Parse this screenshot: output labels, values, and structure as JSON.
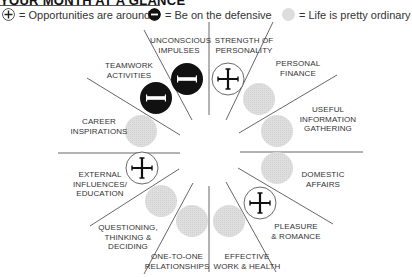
{
  "title": "YOUR MONTH AT A GLANCE",
  "legend": [
    {
      "icon": "plus-circle-icon",
      "text": "= Opportunities are around"
    },
    {
      "icon": "minus-circle-icon",
      "text": "= Be on the defensive"
    },
    {
      "icon": "gray-circle-icon",
      "text": "= Life is pretty ordinary"
    }
  ],
  "colors": {
    "plus": "#ffffff",
    "minus": "#111111",
    "ordinary": "#dcdcdc",
    "lines": "#555555"
  },
  "sectors": [
    {
      "label": "STRENGTH OF\nPERSONALITY",
      "status": "plus"
    },
    {
      "label": "PERSONAL\nFINANCE",
      "status": "ordinary"
    },
    {
      "label": "USEFUL\nINFORMATION\nGATHERING",
      "status": "ordinary"
    },
    {
      "label": "DOMESTIC\nAFFAIRS",
      "status": "ordinary"
    },
    {
      "label": "PLEASURE\n& ROMANCE",
      "status": "plus"
    },
    {
      "label": "EFFECTIVE\nWORK & HEALTH",
      "status": "ordinary"
    },
    {
      "label": "ONE-TO-ONE\nRELATIONSHIPS",
      "status": "ordinary"
    },
    {
      "label": "QUESTIONING,\nTHINKING &\nDECIDING",
      "status": "ordinary"
    },
    {
      "label": "EXTERNAL\nINFLUENCES/\nEDUCATION",
      "status": "plus"
    },
    {
      "label": "CAREER\nINSPIRATIONS",
      "status": "ordinary"
    },
    {
      "label": "TEAMWORK\nACTIVITIES",
      "status": "minus"
    },
    {
      "label": "UNCONSCIOUS\nIMPULSES",
      "status": "minus"
    }
  ]
}
